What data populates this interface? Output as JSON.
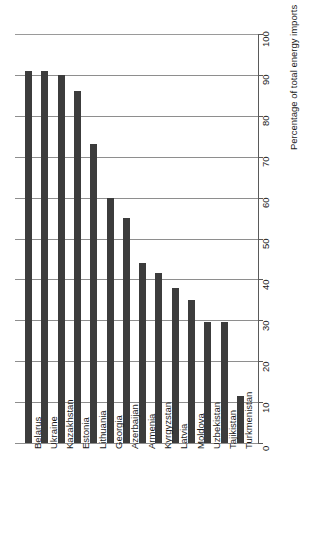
{
  "chart_data": {
    "type": "bar",
    "orientation": "vertical-bars-rotated-page",
    "title": "",
    "xlabel": "",
    "ylabel": "Percentage of total energy imports",
    "ylim": [
      0,
      100
    ],
    "ytick_step": 10,
    "grid": true,
    "legend": false,
    "bar_color": "#3c3c3c",
    "gridline_color": "#8e8e8e",
    "categories": [
      "Belarus",
      "Ukraine",
      "Kazakhstan",
      "Estonia",
      "Lithuania",
      "Georgia",
      "Azerbaijan",
      "Armenia",
      "Kyrgyzstan",
      "Latvia",
      "Moldova",
      "Uzbekistan",
      "Tajikistan",
      "Turkmenistan"
    ],
    "values": [
      91,
      91,
      90,
      86,
      73,
      60,
      55,
      44,
      41.5,
      38,
      35,
      29.5,
      29.5,
      11.5
    ],
    "tick_labels": [
      "0",
      "10",
      "20",
      "30",
      "40",
      "50",
      "60",
      "70",
      "80",
      "90",
      "100"
    ],
    "tick_values": [
      0,
      10,
      20,
      30,
      40,
      50,
      60,
      70,
      80,
      90,
      100
    ]
  }
}
